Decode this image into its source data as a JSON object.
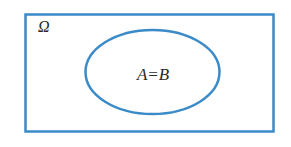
{
  "diagram": {
    "type": "venn",
    "universe_label": "Ω",
    "set_label": "A=B",
    "stroke_color": "#3b8bc9",
    "text_color": "#2a2a2a"
  }
}
